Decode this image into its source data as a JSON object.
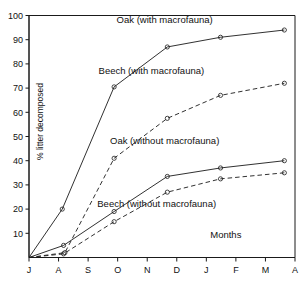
{
  "figure": {
    "top_partial_text": "",
    "months_label": "Months"
  },
  "chart_data": {
    "type": "line",
    "title": "",
    "subtitle": "",
    "xlabel": "Months",
    "ylabel": "% litter decomposed",
    "xlim": [
      0,
      10
    ],
    "ylim": [
      0,
      100
    ],
    "grid": false,
    "legend_position": "inline-annotations",
    "categories": [
      "J",
      "A",
      "S",
      "O",
      "N",
      "D",
      "J",
      "F",
      "M",
      "A"
    ],
    "xtick_labels": [
      "J",
      "A",
      "S",
      "O",
      "N",
      "D",
      "J",
      "F",
      "M",
      "A"
    ],
    "ytick_labels": [
      "10",
      "20",
      "30",
      "40",
      "50",
      "60",
      "70",
      "80",
      "90",
      "100"
    ],
    "ytick_values": [
      10,
      20,
      30,
      40,
      50,
      60,
      70,
      80,
      90,
      100
    ],
    "series": [
      {
        "name": "Oak (with macrofauna)",
        "style": "solid",
        "marker": "circle",
        "x": [
          0,
          1.25,
          3.2,
          5.2,
          7.2,
          9.6
        ],
        "values": [
          0,
          20,
          70.5,
          87,
          91,
          94
        ],
        "annotation": "Oak (with macrofauna)"
      },
      {
        "name": "Beech (with macrofauna)",
        "style": "dashed",
        "marker": "circle",
        "x": [
          0,
          1.35,
          3.2,
          5.2,
          7.2,
          9.6
        ],
        "values": [
          0,
          2,
          41,
          57.5,
          67,
          72
        ],
        "annotation": "Beech (with macrofauna)"
      },
      {
        "name": "Oak (without macrofauna)",
        "style": "solid",
        "marker": "circle",
        "x": [
          0,
          1.3,
          3.2,
          5.2,
          7.2,
          9.6
        ],
        "values": [
          0,
          5,
          19,
          33.5,
          37,
          40
        ],
        "annotation": "Oak (without macrofauna)"
      },
      {
        "name": "Beech (without macrofauna)",
        "style": "dashed",
        "marker": "circle",
        "x": [
          0,
          1.3,
          3.2,
          5.2,
          7.2,
          9.6
        ],
        "values": [
          0,
          1.5,
          14.8,
          27,
          32.5,
          35
        ],
        "annotation": "Beech (without macrofauna)"
      }
    ],
    "annotations": [
      {
        "text": "Oak (with macrofauna)",
        "x": 5.1,
        "y": 97
      },
      {
        "text": "Beech (with macrofauna)",
        "x": 4.6,
        "y": 76
      },
      {
        "text": "Oak (without macrofauna)",
        "x": 5.1,
        "y": 47
      },
      {
        "text": "Beech (without macrofauna)",
        "x": 4.8,
        "y": 21
      },
      {
        "text": "Months",
        "x": 7.4,
        "y": 8
      }
    ],
    "colors": {
      "line": "#1a1a1a",
      "text": "#111111",
      "background": "#ffffff"
    }
  }
}
